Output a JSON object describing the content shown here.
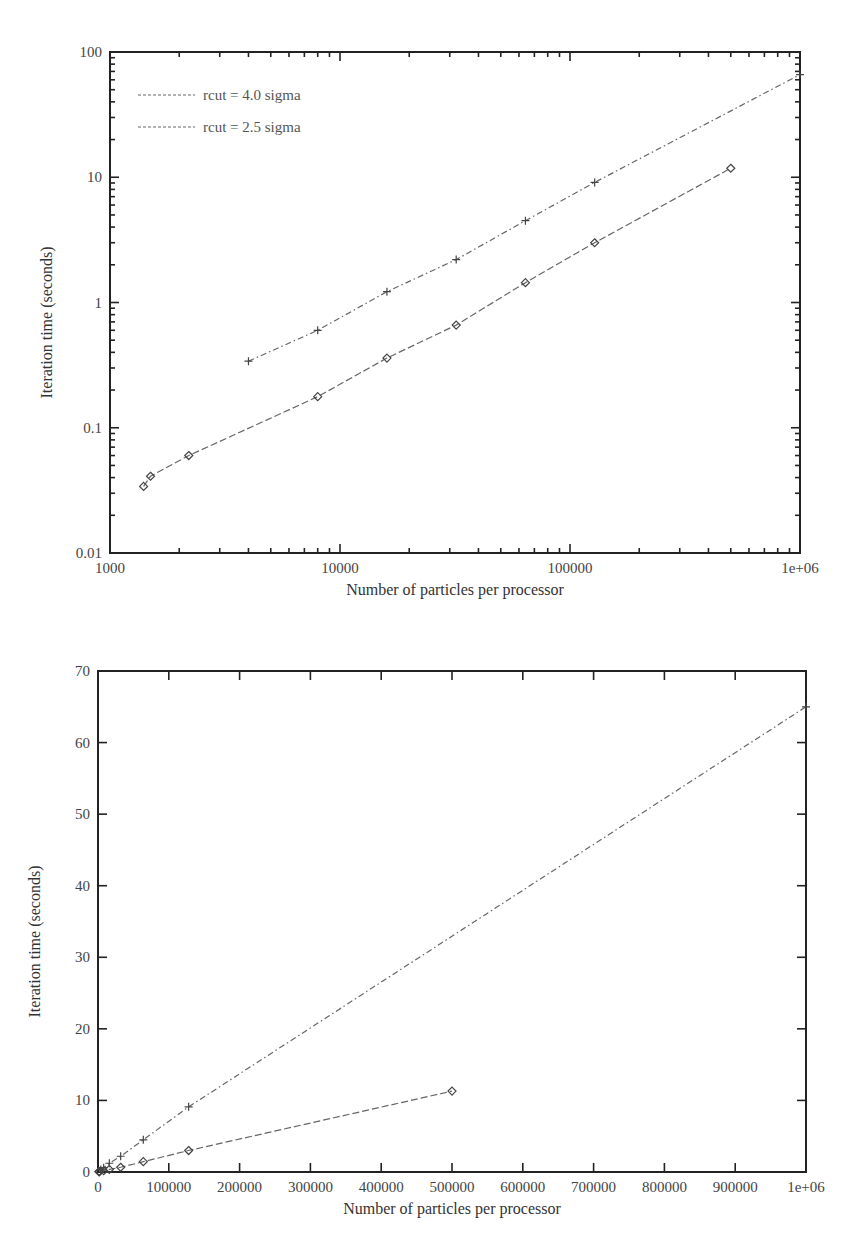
{
  "chart_data": [
    {
      "id": "top",
      "type": "line",
      "title": "",
      "xlabel": "Number of particles per processor",
      "ylabel": "Iteration time (seconds)",
      "xscale": "log",
      "yscale": "log",
      "xlim": [
        1000,
        1000000
      ],
      "ylim": [
        0.01,
        100
      ],
      "xticks": [
        1000,
        10000,
        100000,
        1000000
      ],
      "xtick_labels": [
        "1000",
        "10000",
        "100000",
        "1e+06"
      ],
      "yticks": [
        0.01,
        0.1,
        1,
        10,
        100
      ],
      "ytick_labels": [
        "0.01",
        "0.1",
        "1",
        "10",
        "100"
      ],
      "grid": false,
      "legend_position": "upper-left",
      "series": [
        {
          "name": "rcut = 4.0 sigma",
          "style": "dash-dot",
          "marker": "plus",
          "x": [
            4000,
            8000,
            16000,
            32000,
            64000,
            128000,
            1000000
          ],
          "y": [
            0.34,
            0.6,
            1.22,
            2.2,
            4.5,
            9.1,
            66
          ]
        },
        {
          "name": "rcut = 2.5 sigma",
          "style": "dashed",
          "marker": "diamond",
          "x": [
            1400,
            1500,
            2200,
            8000,
            16000,
            32000,
            64000,
            128000,
            500000
          ],
          "y": [
            0.034,
            0.041,
            0.06,
            0.177,
            0.36,
            0.66,
            1.44,
            3.0,
            11.8
          ]
        }
      ]
    },
    {
      "id": "bottom",
      "type": "line",
      "title": "",
      "xlabel": "Number of particles per processor",
      "ylabel": "Iteration time (seconds)",
      "xscale": "linear",
      "yscale": "linear",
      "xlim": [
        0,
        1000000
      ],
      "ylim": [
        0,
        70
      ],
      "xticks": [
        0,
        100000,
        200000,
        300000,
        400000,
        500000,
        600000,
        700000,
        800000,
        900000,
        1000000
      ],
      "xtick_labels": [
        "0",
        "100000",
        "200000",
        "300000",
        "400000",
        "500000",
        "600000",
        "700000",
        "800000",
        "900000",
        "1e+06"
      ],
      "yticks": [
        0,
        10,
        20,
        30,
        40,
        50,
        60,
        70
      ],
      "ytick_labels": [
        "0",
        "10",
        "20",
        "30",
        "40",
        "50",
        "60",
        "70"
      ],
      "grid": false,
      "legend_position": "none",
      "series": [
        {
          "name": "rcut = 4.0 sigma",
          "style": "dash-dot",
          "marker": "plus",
          "x": [
            4000,
            8000,
            16000,
            32000,
            64000,
            128000,
            1000000
          ],
          "y": [
            0.34,
            0.6,
            1.22,
            2.2,
            4.5,
            9.1,
            65
          ]
        },
        {
          "name": "rcut = 2.5 sigma",
          "style": "dashed",
          "marker": "diamond",
          "x": [
            1400,
            1500,
            2200,
            8000,
            16000,
            32000,
            64000,
            128000,
            500000
          ],
          "y": [
            0.034,
            0.041,
            0.06,
            0.177,
            0.36,
            0.66,
            1.44,
            3.0,
            11.3
          ]
        }
      ]
    }
  ],
  "layout": {
    "top": {
      "left": 110,
      "right": 800,
      "top": 52,
      "bottom": 553,
      "show_legend": true
    },
    "bottom": {
      "left": 98,
      "right": 806,
      "top": 51,
      "bottom": 552,
      "show_legend": false
    }
  }
}
